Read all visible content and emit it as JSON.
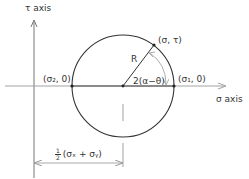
{
  "diagram": {
    "colors": {
      "line": "#333333",
      "axis": "#555555",
      "dimension": "#999999",
      "background": "#ffffff"
    },
    "axes": {
      "tau_label": "τ axis",
      "sigma_label": "σ axis"
    },
    "points": {
      "sigma2": "(σ₂, 0)",
      "sigma1": "(σ₁, 0)",
      "sigma_tau": "(σ, τ)"
    },
    "radius_label": "R",
    "angle_label": "2(α−θ)",
    "center_dimension": {
      "fraction_num": "1",
      "fraction_den": "2",
      "expression": "(σₓ + σᵧ)"
    }
  }
}
